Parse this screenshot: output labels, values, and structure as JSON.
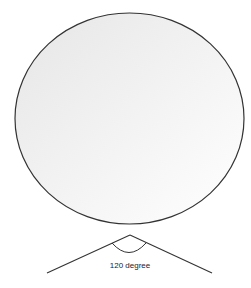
{
  "diagram": {
    "shapes": [
      {
        "name": "ellipse",
        "kind": "ellipse",
        "fill_gradient": [
          "#e6e6e6",
          "#ffffff"
        ],
        "stroke": "#333333"
      },
      {
        "name": "angle",
        "kind": "angle",
        "stroke": "#333333"
      }
    ],
    "angle": {
      "degrees": 120,
      "label": "120 degree"
    }
  }
}
